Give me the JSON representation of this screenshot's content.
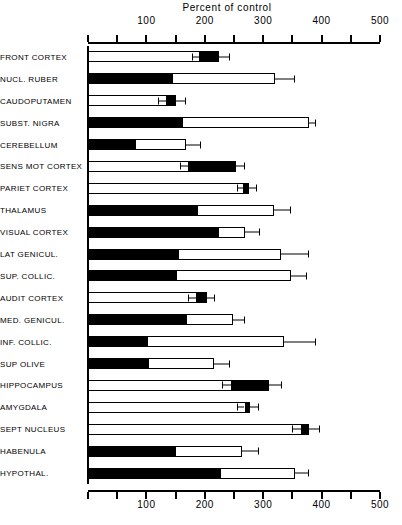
{
  "chart_data": {
    "type": "bar",
    "title": "Percent of control",
    "xlabel": "Percent of control",
    "ylabel": "",
    "orientation": "horizontal",
    "xlim": [
      0,
      500
    ],
    "xticks": [
      0,
      50,
      100,
      150,
      200,
      250,
      300,
      350,
      400,
      450,
      500
    ],
    "xticklabels": [
      "",
      "",
      "100",
      "",
      "200",
      "",
      "300",
      "",
      "400",
      "",
      "500"
    ],
    "grid": false,
    "legend": null,
    "axis_position": "both",
    "note": "Each row is a two-segment horizontal bar: an open (white) segment and a solid (black) segment, drawn end-to-end from 0. The total bar length is the outer value; the boundary between segments is the inner value. A horizontal error whisker extends past the bar end.",
    "categories": [
      "FRONT CORTEX",
      "NUCL. RUBER",
      "CAUDOPUTAMEN",
      "SUBST. NIGRA",
      "CEREBELLUM",
      "SENS MOT CORTEX",
      "PARIET CORTEX",
      "THALAMUS",
      "VISUAL CORTEX",
      "LAT GENICUL.",
      "SUP. COLLIC.",
      "AUDIT CORTEX",
      "MED. GENICUL.",
      "INF. COLLIC.",
      "SUP OLIVE",
      "HIPPOCAMPUS",
      "AMYGDALA",
      "SEPT NUCLEUS",
      "HABENULA",
      "HYPOTHAL."
    ],
    "series": [
      {
        "name": "inner segment boundary",
        "values": [
          190,
          145,
          133,
          163,
          83,
          172,
          265,
          188,
          225,
          155,
          153,
          185,
          170,
          103,
          105,
          245,
          268,
          365,
          150,
          228
        ]
      },
      {
        "name": "bar total (outer end)",
        "values": [
          225,
          320,
          150,
          378,
          168,
          253,
          275,
          318,
          268,
          330,
          348,
          203,
          248,
          335,
          215,
          310,
          278,
          378,
          263,
          355
        ]
      }
    ],
    "error_ends": [
      243,
      355,
      168,
      390,
      193,
      268,
      290,
      348,
      295,
      378,
      375,
      218,
      268,
      390,
      243,
      333,
      293,
      398,
      293,
      378
    ],
    "inner_error_start": [
      178,
      136,
      120,
      150,
      72,
      158,
      255,
      176,
      213,
      145,
      143,
      172,
      160,
      93,
      95,
      230,
      255,
      350,
      140,
      215
    ],
    "points": [
      {
        "category": "FRONT CORTEX",
        "inner": 190,
        "total": 225,
        "error": 243,
        "fill_side": "outer"
      },
      {
        "category": "NUCL. RUBER",
        "inner": 145,
        "total": 320,
        "error": 355,
        "fill_side": "inner"
      },
      {
        "category": "CAUDOPUTAMEN",
        "inner": 133,
        "total": 150,
        "error": 168,
        "fill_side": "outer"
      },
      {
        "category": "SUBST. NIGRA",
        "inner": 163,
        "total": 378,
        "error": 390,
        "fill_side": "inner"
      },
      {
        "category": "CEREBELLUM",
        "inner": 83,
        "total": 168,
        "error": 193,
        "fill_side": "inner"
      },
      {
        "category": "SENS MOT CORTEX",
        "inner": 172,
        "total": 253,
        "error": 268,
        "fill_side": "outer"
      },
      {
        "category": "PARIET CORTEX",
        "inner": 265,
        "total": 275,
        "error": 290,
        "fill_side": "outer"
      },
      {
        "category": "THALAMUS",
        "inner": 188,
        "total": 318,
        "error": 348,
        "fill_side": "inner"
      },
      {
        "category": "VISUAL CORTEX",
        "inner": 225,
        "total": 268,
        "error": 295,
        "fill_side": "inner"
      },
      {
        "category": "LAT GENICUL.",
        "inner": 155,
        "total": 330,
        "error": 378,
        "fill_side": "inner"
      },
      {
        "category": "SUP. COLLIC.",
        "inner": 153,
        "total": 348,
        "error": 375,
        "fill_side": "inner"
      },
      {
        "category": "AUDIT CORTEX",
        "inner": 185,
        "total": 203,
        "error": 218,
        "fill_side": "outer"
      },
      {
        "category": "MED. GENICUL.",
        "inner": 170,
        "total": 248,
        "error": 268,
        "fill_side": "inner"
      },
      {
        "category": "INF. COLLIC.",
        "inner": 103,
        "total": 335,
        "error": 390,
        "fill_side": "inner"
      },
      {
        "category": "SUP OLIVE",
        "inner": 105,
        "total": 215,
        "error": 243,
        "fill_side": "inner"
      },
      {
        "category": "HIPPOCAMPUS",
        "inner": 245,
        "total": 310,
        "error": 333,
        "fill_side": "outer"
      },
      {
        "category": "AMYGDALA",
        "inner": 268,
        "total": 278,
        "error": 293,
        "fill_side": "outer"
      },
      {
        "category": "SEPT NUCLEUS",
        "inner": 365,
        "total": 378,
        "error": 398,
        "fill_side": "outer"
      },
      {
        "category": "HABENULA",
        "inner": 150,
        "total": 263,
        "error": 293,
        "fill_side": "inner"
      },
      {
        "category": "HYPOTHAL.",
        "inner": 228,
        "total": 355,
        "error": 378,
        "fill_side": "inner"
      }
    ]
  },
  "colors": {
    "ink": "#000000",
    "paper": "#ffffff",
    "bar_fill": "#000000",
    "bar_open": "#ffffff"
  }
}
